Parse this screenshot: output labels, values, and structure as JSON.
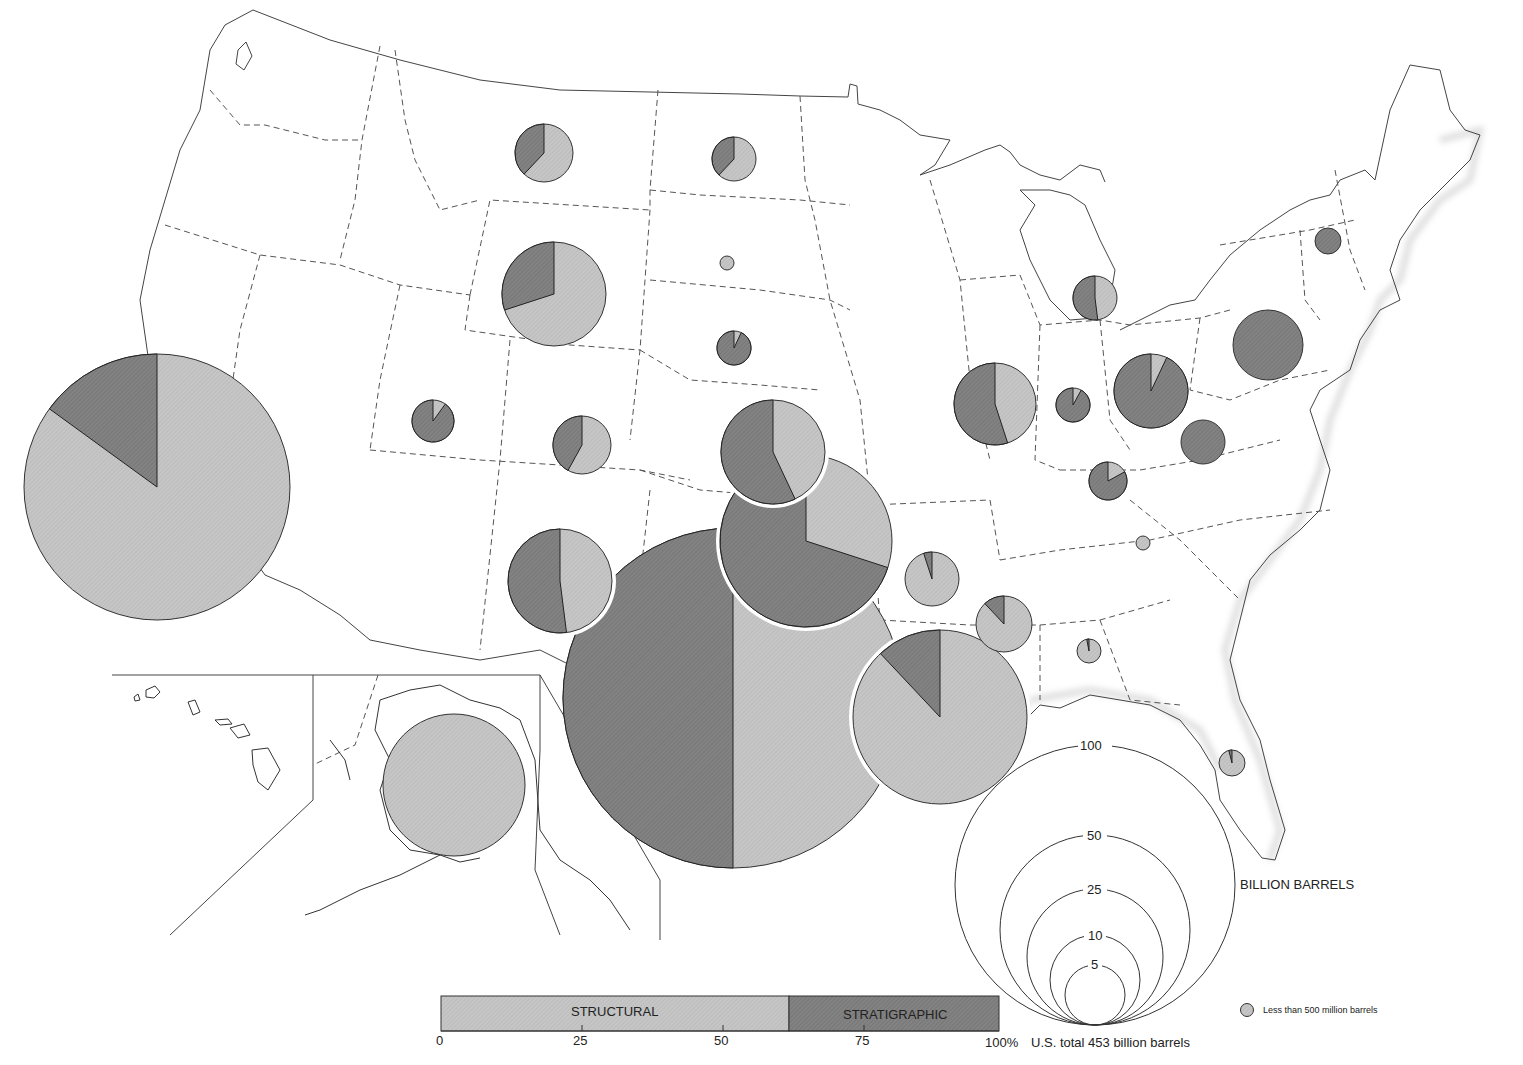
{
  "map": {
    "subject": "Oil in place by trap type, by state",
    "colors": {
      "structural": "#c4c4c4",
      "stratigraphic": "#7e7e7e",
      "outline": "#333333",
      "border": "#555555"
    }
  },
  "legend": {
    "composition_bar": {
      "structural_label": "STRUCTURAL",
      "stratigraphic_label": "STRATIGRAPHIC",
      "structural_share_pct": 62,
      "ticks": [
        "0",
        "25",
        "50",
        "75",
        "100%"
      ]
    },
    "us_total": "U.S. total 453 billion barrels",
    "size_scale": {
      "unit_label": "BILLION BARRELS",
      "circles": [
        "100",
        "50",
        "25",
        "10",
        "5"
      ]
    },
    "small_marker_label": "Less than 500 million barrels"
  },
  "chart_data": {
    "type": "pie",
    "legend": [
      "STRUCTURAL",
      "STRATIGRAPHIC"
    ],
    "size_scale_billion_barrels": [
      100,
      50,
      25,
      10,
      5
    ],
    "us_total_billion_barrels": 453,
    "us_structural_pct": 62,
    "us_stratigraphic_pct": 38,
    "pies": [
      {
        "region": "California",
        "size_bbl_est": 84,
        "structural_pct": 85,
        "stratigraphic_pct": 15
      },
      {
        "region": "Texas",
        "size_bbl_est": 170,
        "structural_pct": 50,
        "stratigraphic_pct": 50
      },
      {
        "region": "Oklahoma",
        "size_bbl_est": 43,
        "structural_pct": 30,
        "stratigraphic_pct": 70
      },
      {
        "region": "Kansas",
        "size_bbl_est": 22,
        "structural_pct": 43,
        "stratigraphic_pct": 57
      },
      {
        "region": "Louisiana",
        "size_bbl_est": 56,
        "structural_pct": 88,
        "stratigraphic_pct": 12
      },
      {
        "region": "Alaska",
        "size_bbl_est": 42,
        "structural_pct": 100,
        "stratigraphic_pct": 0
      },
      {
        "region": "Wyoming",
        "size_bbl_est": 22,
        "structural_pct": 70,
        "stratigraphic_pct": 30
      },
      {
        "region": "New Mexico",
        "size_bbl_est": 22,
        "structural_pct": 48,
        "stratigraphic_pct": 52
      },
      {
        "region": "Illinois",
        "size_bbl_est": 13,
        "structural_pct": 45,
        "stratigraphic_pct": 55
      },
      {
        "region": "Montana",
        "size_bbl_est": 7,
        "structural_pct": 62,
        "stratigraphic_pct": 38
      },
      {
        "region": "North Dakota",
        "size_bbl_est": 3.5,
        "structural_pct": 62,
        "stratigraphic_pct": 38
      },
      {
        "region": "South Dakota",
        "size_bbl_est": 0.4,
        "structural_pct": 100,
        "stratigraphic_pct": 0,
        "note": "Less than 500 million barrels"
      },
      {
        "region": "Nebraska",
        "size_bbl_est": 2.5,
        "structural_pct": 7,
        "stratigraphic_pct": 93
      },
      {
        "region": "Utah",
        "size_bbl_est": 3.5,
        "structural_pct": 10,
        "stratigraphic_pct": 90
      },
      {
        "region": "Colorado",
        "size_bbl_est": 6,
        "structural_pct": 58,
        "stratigraphic_pct": 42
      },
      {
        "region": "Arkansas",
        "size_bbl_est": 6,
        "structural_pct": 95,
        "stratigraphic_pct": 5
      },
      {
        "region": "Mississippi",
        "size_bbl_est": 5.5,
        "structural_pct": 88,
        "stratigraphic_pct": 12
      },
      {
        "region": "Alabama",
        "size_bbl_est": 1,
        "structural_pct": 97,
        "stratigraphic_pct": 3
      },
      {
        "region": "Florida",
        "size_bbl_est": 1.5,
        "structural_pct": 96,
        "stratigraphic_pct": 4
      },
      {
        "region": "Michigan",
        "size_bbl_est": 4.5,
        "structural_pct": 48,
        "stratigraphic_pct": 52
      },
      {
        "region": "Indiana",
        "size_bbl_est": 2.3,
        "structural_pct": 8,
        "stratigraphic_pct": 92
      },
      {
        "region": "Ohio",
        "size_bbl_est": 12,
        "structural_pct": 7,
        "stratigraphic_pct": 93
      },
      {
        "region": "Kentucky",
        "size_bbl_est": 3,
        "structural_pct": 17,
        "stratigraphic_pct": 83
      },
      {
        "region": "West Virginia",
        "size_bbl_est": 4.5,
        "structural_pct": 0,
        "stratigraphic_pct": 100
      },
      {
        "region": "Pennsylvania",
        "size_bbl_est": 10.5,
        "structural_pct": 0,
        "stratigraphic_pct": 100
      },
      {
        "region": "New York",
        "size_bbl_est": 1.8,
        "structural_pct": 0,
        "stratigraphic_pct": 100
      },
      {
        "region": "Tennessee",
        "size_bbl_est": 0.4,
        "structural_pct": 100,
        "stratigraphic_pct": 0,
        "note": "Less than 500 million barrels"
      }
    ]
  }
}
